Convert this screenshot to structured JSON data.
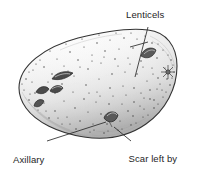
{
  "figure": {
    "illustration_style": "pen-and-ink stipple drawing",
    "background_color": "#ffffff",
    "ink_color": "#2b2b2b",
    "text_color": "#1e1e1e",
    "shade_color": "#8b8b8b"
  },
  "labels": {
    "lenticels": {
      "text": "Lenticels",
      "lines": [
        "Lenticels"
      ]
    },
    "axillary_buds": {
      "text": "Axillary buds",
      "lines": [
        "Axillary",
        "buds"
      ]
    },
    "scar": {
      "text": "Scar left by scale leaf",
      "lines": [
        "Scar left by",
        "scale leaf"
      ]
    }
  },
  "leaders": {
    "lenticels": {
      "from": [
        148,
        27
      ],
      "to": [
        135,
        77
      ]
    },
    "axillary_buds": {
      "from": [
        47,
        141
      ],
      "to": [
        106,
        122
      ]
    },
    "scar": {
      "from": [
        131,
        141
      ],
      "to": [
        114,
        127
      ]
    }
  },
  "tuber": {
    "outline_bounds": {
      "x": 17,
      "y": 29,
      "width": 160,
      "height": 110
    },
    "eyes": [
      {
        "name": "eye-left-upper",
        "cx": 62,
        "cy": 76
      },
      {
        "name": "eye-left-cluster-a",
        "cx": 44,
        "cy": 90
      },
      {
        "name": "eye-left-cluster-b",
        "cx": 53,
        "cy": 89
      },
      {
        "name": "eye-left-lower",
        "cx": 40,
        "cy": 104
      },
      {
        "name": "eye-top-right",
        "cx": 148,
        "cy": 53
      },
      {
        "name": "eye-right-edge",
        "cx": 168,
        "cy": 72
      },
      {
        "name": "eye-bottom-center",
        "cx": 110,
        "cy": 120
      }
    ],
    "lenticel_count": 120
  }
}
